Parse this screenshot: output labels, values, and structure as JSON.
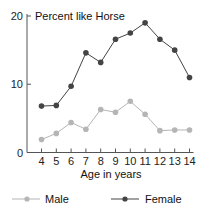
{
  "chart_data": {
    "type": "line",
    "title": "Percent like Horse",
    "xlabel": "Age in years",
    "ylabel": "",
    "x": [
      4,
      5,
      6,
      7,
      8,
      9,
      10,
      11,
      12,
      13,
      14
    ],
    "categories": [
      "4",
      "5",
      "6",
      "7",
      "8",
      "9",
      "10",
      "11",
      "12",
      "13",
      "14"
    ],
    "yticks": [
      0,
      10,
      20
    ],
    "ylim": [
      0,
      20
    ],
    "grid": false,
    "legend_position": "bottom",
    "series": [
      {
        "name": "Male",
        "color": "#b5b5b5",
        "values": [
          1.9,
          2.8,
          4.4,
          3.4,
          6.3,
          5.9,
          7.5,
          5.6,
          3.2,
          3.3,
          3.3
        ]
      },
      {
        "name": "Female",
        "color": "#444444",
        "values": [
          6.8,
          6.9,
          9.7,
          14.6,
          13.2,
          16.6,
          17.5,
          19.0,
          16.6,
          15.0,
          11.0
        ]
      }
    ]
  },
  "legend": {
    "male_label": "Male",
    "female_label": "Female"
  }
}
